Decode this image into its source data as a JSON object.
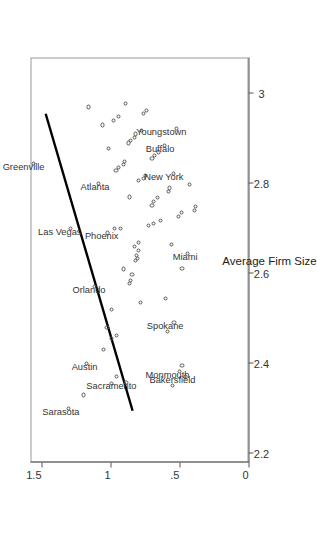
{
  "figure": {
    "orientation": "rotated-90-ccw",
    "background": "#ffffff",
    "frame_color": "#999999",
    "point_color": "#555555",
    "line_color": "#000000"
  },
  "chart_data": {
    "type": "scatter",
    "title": "",
    "xlabel": "Average Firm Size, 1977",
    "ylabel": "",
    "xlim": [
      2.18,
      3.08
    ],
    "ylim": [
      0,
      1.58
    ],
    "grid": false,
    "legend": null,
    "xticks": [
      "2.2",
      "2.4",
      "2.6",
      "2.8",
      "3"
    ],
    "xtickvalues": [
      2.2,
      2.4,
      2.6,
      2.8,
      3.0
    ],
    "yticks": [
      "0",
      ".5",
      "1",
      "1.5"
    ],
    "ytickvalues": [
      0,
      0.5,
      1.0,
      1.5
    ],
    "fit_line": {
      "x": [
        2.295,
        2.955
      ],
      "y": [
        0.84,
        1.47
      ]
    },
    "points": [
      {
        "x": 2.3,
        "y": 1.305,
        "label": "Sarasota",
        "label_dx": -3,
        "label_dy": 6,
        "label_anchor": "end"
      },
      {
        "x": 2.33,
        "y": 1.195,
        "label": null
      },
      {
        "x": 2.356,
        "y": 0.995,
        "label": null
      },
      {
        "x": 2.372,
        "y": 0.955,
        "label": null
      },
      {
        "x": 2.358,
        "y": 0.888,
        "label": "Sacramento",
        "label_dx": -3,
        "label_dy": 6,
        "label_anchor": "end"
      },
      {
        "x": 2.352,
        "y": 0.55,
        "label": null
      },
      {
        "x": 2.382,
        "y": 0.5,
        "label": "Monmouth",
        "label_dx": -3,
        "label_dy": 5,
        "label_anchor": "end"
      },
      {
        "x": 2.37,
        "y": 0.455,
        "label": "Bakersfield",
        "label_dx": -3,
        "label_dy": 5,
        "label_anchor": "end"
      },
      {
        "x": 2.395,
        "y": 0.482,
        "label": null
      },
      {
        "x": 2.4,
        "y": 1.175,
        "label": "Austin",
        "label_dx": -3,
        "label_dy": 6,
        "label_anchor": "end"
      },
      {
        "x": 2.432,
        "y": 1.05,
        "label": null
      },
      {
        "x": 2.456,
        "y": 0.99,
        "label": null
      },
      {
        "x": 2.462,
        "y": 0.958,
        "label": null
      },
      {
        "x": 2.48,
        "y": 1.025,
        "label": null
      },
      {
        "x": 2.472,
        "y": 0.59,
        "label": null
      },
      {
        "x": 2.492,
        "y": 0.54,
        "label": "Spokane",
        "label_dx": -3,
        "label_dy": 5,
        "label_anchor": "end"
      },
      {
        "x": 2.52,
        "y": 0.99,
        "label": null
      },
      {
        "x": 2.535,
        "y": 0.78,
        "label": null
      },
      {
        "x": 2.545,
        "y": 0.6,
        "label": null
      },
      {
        "x": 2.572,
        "y": 1.115,
        "label": "Orlando",
        "label_dx": -3,
        "label_dy": 6,
        "label_anchor": "end"
      },
      {
        "x": 2.578,
        "y": 0.86,
        "label": null
      },
      {
        "x": 2.585,
        "y": 0.855,
        "label": null
      },
      {
        "x": 2.598,
        "y": 0.845,
        "label": null
      },
      {
        "x": 2.61,
        "y": 0.905,
        "label": null
      },
      {
        "x": 2.612,
        "y": 0.482,
        "label": null
      },
      {
        "x": 2.628,
        "y": 0.818,
        "label": null
      },
      {
        "x": 2.634,
        "y": 0.805,
        "label": null
      },
      {
        "x": 2.64,
        "y": 0.812,
        "label": null
      },
      {
        "x": 2.652,
        "y": 0.8,
        "label": null
      },
      {
        "x": 2.66,
        "y": 0.828,
        "label": null
      },
      {
        "x": 2.668,
        "y": 0.795,
        "label": null
      },
      {
        "x": 2.644,
        "y": 0.445,
        "label": "Miami",
        "label_dx": -3,
        "label_dy": 5,
        "label_anchor": "end"
      },
      {
        "x": 2.665,
        "y": 0.56,
        "label": null
      },
      {
        "x": 2.69,
        "y": 1.02,
        "label": "Phoenix",
        "label_dx": -3,
        "label_dy": 6,
        "label_anchor": "end"
      },
      {
        "x": 2.7,
        "y": 0.97,
        "label": null
      },
      {
        "x": 2.7,
        "y": 0.93,
        "label": null
      },
      {
        "x": 2.706,
        "y": 0.722,
        "label": null
      },
      {
        "x": 2.712,
        "y": 0.69,
        "label": null
      },
      {
        "x": 2.718,
        "y": 0.64,
        "label": null
      },
      {
        "x": 2.726,
        "y": 0.505,
        "label": null
      },
      {
        "x": 2.735,
        "y": 0.485,
        "label": null
      },
      {
        "x": 2.74,
        "y": 0.39,
        "label": null
      },
      {
        "x": 2.748,
        "y": 0.385,
        "label": null
      },
      {
        "x": 2.752,
        "y": 0.7,
        "label": null
      },
      {
        "x": 2.76,
        "y": 0.69,
        "label": null
      },
      {
        "x": 2.768,
        "y": 0.66,
        "label": null
      },
      {
        "x": 2.77,
        "y": 0.865,
        "label": null
      },
      {
        "x": 2.782,
        "y": 0.578,
        "label": null
      },
      {
        "x": 2.79,
        "y": 0.57,
        "label": null
      },
      {
        "x": 2.797,
        "y": 0.43,
        "label": null
      },
      {
        "x": 2.8,
        "y": 1.09,
        "label": "Atlanta",
        "label_dx": -3,
        "label_dy": 6,
        "label_anchor": "end"
      },
      {
        "x": 2.806,
        "y": 0.795,
        "label": null
      },
      {
        "x": 2.812,
        "y": 0.76,
        "label": null
      },
      {
        "x": 2.818,
        "y": 0.745,
        "label": null
      },
      {
        "x": 2.822,
        "y": 0.545,
        "label": "New York",
        "label_dx": -3,
        "label_dy": 5,
        "label_anchor": "end"
      },
      {
        "x": 2.828,
        "y": 0.96,
        "label": null
      },
      {
        "x": 2.836,
        "y": 0.94,
        "label": null
      },
      {
        "x": 2.842,
        "y": 0.905,
        "label": null
      },
      {
        "x": 2.848,
        "y": 0.9,
        "label": null
      },
      {
        "x": 2.856,
        "y": 0.7,
        "label": null
      },
      {
        "x": 2.862,
        "y": 0.682,
        "label": null
      },
      {
        "x": 2.87,
        "y": 0.655,
        "label": null
      },
      {
        "x": 2.878,
        "y": 1.012,
        "label": null
      },
      {
        "x": 2.884,
        "y": 0.608,
        "label": "Buffalo",
        "label_dx": -3,
        "label_dy": 5,
        "label_anchor": "end"
      },
      {
        "x": 2.89,
        "y": 0.872,
        "label": null
      },
      {
        "x": 2.896,
        "y": 0.855,
        "label": null
      },
      {
        "x": 2.902,
        "y": 0.828,
        "label": null
      },
      {
        "x": 2.91,
        "y": 0.82,
        "label": null
      },
      {
        "x": 2.918,
        "y": 0.775,
        "label": null
      },
      {
        "x": 2.922,
        "y": 0.52,
        "label": "Youngstown",
        "label_dx": -3,
        "label_dy": 5,
        "label_anchor": "end"
      },
      {
        "x": 2.93,
        "y": 1.06,
        "label": null
      },
      {
        "x": 2.94,
        "y": 0.98,
        "label": null
      },
      {
        "x": 2.948,
        "y": 0.945,
        "label": null
      },
      {
        "x": 2.955,
        "y": 0.76,
        "label": null
      },
      {
        "x": 2.962,
        "y": 0.74,
        "label": null
      },
      {
        "x": 2.97,
        "y": 1.16,
        "label": null
      },
      {
        "x": 2.978,
        "y": 0.89,
        "label": null
      },
      {
        "x": 2.7,
        "y": 1.29,
        "label": "Las Vegas",
        "label_dx": -3,
        "label_dy": 6,
        "label_anchor": "end"
      },
      {
        "x": 2.845,
        "y": 1.56,
        "label": "Greenville",
        "label_dx": -3,
        "label_dy": 6,
        "label_anchor": "end"
      }
    ]
  }
}
